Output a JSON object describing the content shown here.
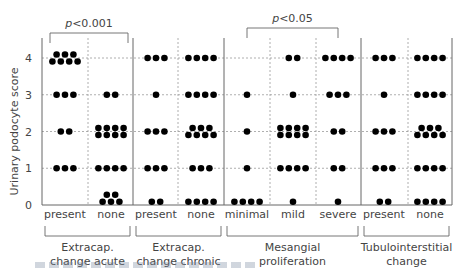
{
  "chart_data": {
    "type": "scatter",
    "subtype": "dot-plot",
    "ylabel": "Urinary podocyte score",
    "yticks": [
      0,
      1,
      2,
      3,
      4
    ],
    "ylim": [
      0,
      4
    ],
    "grid": true,
    "groups": [
      {
        "label_line1": "Extracap.",
        "label_line2": "change acute",
        "categories": [
          "present",
          "none"
        ],
        "counts_by_score": [
          {
            "category": "present",
            "0": 0,
            "1": 3,
            "2": 2,
            "3": 3,
            "4": 7
          },
          {
            "category": "none",
            "0": 5,
            "1": 4,
            "2": 8,
            "3": 2,
            "4": 0
          }
        ]
      },
      {
        "label_line1": "Extracap.",
        "label_line2": "change chronic",
        "categories": [
          "present",
          "none"
        ],
        "counts_by_score": [
          {
            "category": "present",
            "0": 2,
            "1": 3,
            "2": 3,
            "3": 1,
            "4": 3
          },
          {
            "category": "none",
            "0": 4,
            "1": 3,
            "2": 7,
            "3": 4,
            "4": 4
          }
        ]
      },
      {
        "label_line1": "Mesangial",
        "label_line2": "proliferation",
        "categories": [
          "minimal",
          "mild",
          "severe"
        ],
        "counts_by_score": [
          {
            "category": "minimal",
            "0": 4,
            "1": 1,
            "2": 1,
            "3": 1,
            "4": 0
          },
          {
            "category": "mild",
            "0": 1,
            "1": 4,
            "2": 8,
            "3": 1,
            "4": 2
          },
          {
            "category": "severe",
            "0": 1,
            "1": 2,
            "2": 2,
            "3": 3,
            "4": 4
          }
        ]
      },
      {
        "label_line1": "Tubulointerstitial",
        "label_line2": "change",
        "categories": [
          "present",
          "none"
        ],
        "counts_by_score": [
          {
            "category": "present",
            "0": 2,
            "1": 3,
            "2": 3,
            "3": 1,
            "4": 3
          },
          {
            "category": "none",
            "0": 4,
            "1": 4,
            "2": 7,
            "3": 4,
            "4": 4
          }
        ]
      }
    ],
    "annotations": [
      {
        "text_italic": "p",
        "text": "<0.001",
        "between": [
          "Extracap. change acute: present",
          "Extracap. change acute: none"
        ]
      },
      {
        "text_italic": "p",
        "text": "<0.05",
        "between": [
          "Mesangial proliferation: minimal",
          "Mesangial proliferation: severe"
        ]
      }
    ]
  },
  "layout": {
    "plot_left": 42,
    "plot_right": 452,
    "y0": 205,
    "y4": 58,
    "columns": [
      {
        "x": 65
      },
      {
        "x": 111
      },
      {
        "x": 156
      },
      {
        "x": 201
      },
      {
        "x": 247
      },
      {
        "x": 293
      },
      {
        "x": 338
      },
      {
        "x": 384
      },
      {
        "x": 430
      }
    ],
    "solid_separators": [
      133,
      224,
      361
    ],
    "dashed_separators": [
      88,
      178,
      270,
      316,
      408
    ],
    "group_spans": [
      [
        42,
        133
      ],
      [
        133,
        224
      ],
      [
        224,
        361
      ],
      [
        361,
        452
      ]
    ],
    "brackets": [
      {
        "x1": 50,
        "x2": 128,
        "y": 33
      },
      {
        "x1": 247,
        "x2": 338,
        "y": 28
      }
    ],
    "colors": {
      "dot": "#000000",
      "axis": "#666666",
      "grid": "#9a9a9a",
      "text": "#444444"
    }
  }
}
